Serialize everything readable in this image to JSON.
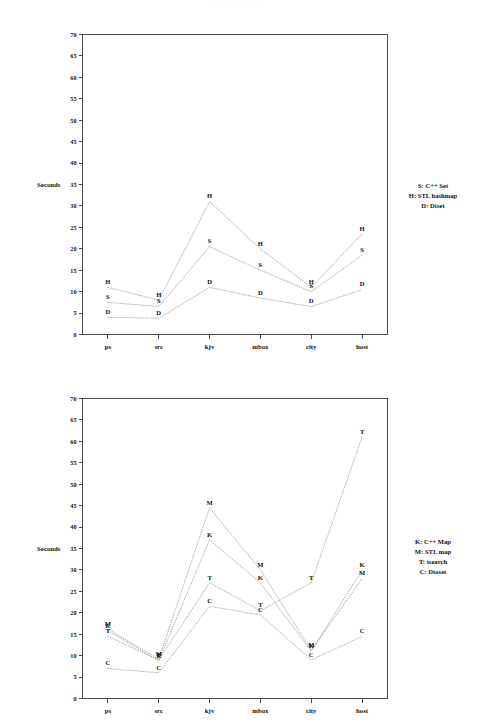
{
  "page": {
    "faint_header_text": "·················",
    "background_color": "#ffffff",
    "ink_color": "#111111",
    "line_color": "#9a9a9a",
    "axis_color": "#4c4c4c"
  },
  "charts": [
    {
      "id": "set-benchmark",
      "axis_title": "Seconds",
      "legend": [
        {
          "key": "S",
          "text": "S: C++ Set"
        },
        {
          "key": "H",
          "text": "H: STL hashmap"
        },
        {
          "key": "D",
          "text": "D: Dtset"
        }
      ]
    },
    {
      "id": "map-benchmark",
      "axis_title": "Seconds",
      "legend": [
        {
          "key": "K",
          "text": "K: C++ Map"
        },
        {
          "key": "M",
          "text": "M: STL map"
        },
        {
          "key": "T",
          "text": "T: tsearch"
        },
        {
          "key": "C",
          "text": "C: Dtoset"
        }
      ]
    }
  ],
  "chart_data": [
    {
      "type": "line",
      "id": "set-benchmark",
      "title": "",
      "xlabel": "",
      "ylabel": "Seconds",
      "ylim": [
        0,
        70
      ],
      "ytick_step": 5,
      "yticks": [
        0,
        5,
        10,
        15,
        20,
        25,
        30,
        35,
        40,
        45,
        50,
        55,
        60,
        65,
        70
      ],
      "grid": false,
      "legend_position": "right",
      "categories": [
        "ps",
        "src",
        "kjv",
        "mbox",
        "city",
        "host"
      ],
      "series": [
        {
          "name": "H: STL hashmap",
          "marker": "H",
          "values": [
            11.0,
            8.0,
            31.0,
            20.0,
            11.0,
            23.5
          ]
        },
        {
          "name": "S: C++ Set",
          "marker": "S",
          "values": [
            7.5,
            6.5,
            20.5,
            15.0,
            10.0,
            18.5
          ]
        },
        {
          "name": "D: Dtset",
          "marker": "D",
          "values": [
            4.0,
            3.8,
            11.0,
            8.5,
            6.5,
            10.5
          ]
        }
      ]
    },
    {
      "type": "line",
      "id": "map-benchmark",
      "title": "",
      "xlabel": "",
      "ylabel": "Seconds",
      "ylim": [
        0,
        70
      ],
      "ytick_step": 5,
      "yticks": [
        0,
        5,
        10,
        15,
        20,
        25,
        30,
        35,
        40,
        45,
        50,
        55,
        60,
        65,
        70
      ],
      "grid": false,
      "legend_position": "right",
      "categories": [
        "ps",
        "src",
        "kjv",
        "mbox",
        "city",
        "host"
      ],
      "series": [
        {
          "name": "M: STL map",
          "marker": "M",
          "values": [
            16.2,
            9.2,
            44.5,
            30.0,
            11.2,
            28.0
          ]
        },
        {
          "name": "K: C++ Map",
          "marker": "K",
          "values": [
            15.8,
            8.8,
            37.0,
            27.0,
            11.0,
            30.0
          ]
        },
        {
          "name": "T: tsearch",
          "marker": "T",
          "values": [
            14.5,
            9.0,
            27.0,
            20.5,
            27.0,
            61.0
          ]
        },
        {
          "name": "C: Dtoset",
          "marker": "C",
          "values": [
            7.0,
            6.0,
            21.5,
            19.5,
            9.0,
            14.5
          ]
        }
      ]
    }
  ]
}
